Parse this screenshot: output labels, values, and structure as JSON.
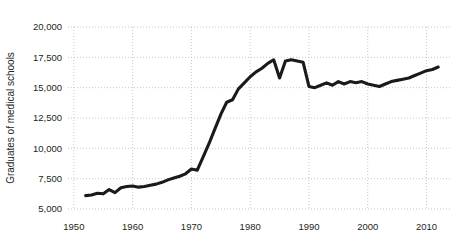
{
  "chart_data": {
    "type": "line",
    "title": "",
    "subtitle": "",
    "xlabel": "",
    "ylabel": "Graduates of medical schools",
    "xlim": [
      1949,
      2014
    ],
    "ylim": [
      5000,
      20000
    ],
    "grid": true,
    "legend": null,
    "legend_position": "none",
    "line_color": "#1a1a1a",
    "grid_color": "#b9b9b9",
    "background_color": "#ffffff",
    "x_tick_labels": [
      "1950",
      "1960",
      "1970",
      "1980",
      "1990",
      "2000",
      "2010"
    ],
    "x_ticks": [
      1950,
      1960,
      1970,
      1980,
      1990,
      2000,
      2010
    ],
    "y_tick_labels": [
      "5,000",
      "7,500",
      "10,000",
      "12,500",
      "15,000",
      "17,500",
      "20,000"
    ],
    "y_ticks": [
      5000,
      7500,
      10000,
      12500,
      15000,
      17500,
      20000
    ],
    "series": [
      {
        "name": "Graduates of medical schools",
        "x": [
          1952,
          1953,
          1954,
          1955,
          1956,
          1957,
          1958,
          1959,
          1960,
          1961,
          1962,
          1963,
          1964,
          1965,
          1966,
          1967,
          1968,
          1969,
          1970,
          1971,
          1972,
          1973,
          1974,
          1975,
          1976,
          1977,
          1978,
          1979,
          1980,
          1981,
          1982,
          1983,
          1984,
          1985,
          1986,
          1987,
          1988,
          1989,
          1990,
          1991,
          1992,
          1993,
          1994,
          1995,
          1996,
          1997,
          1998,
          1999,
          2000,
          2001,
          2002,
          2003,
          2004,
          2005,
          2006,
          2007,
          2008,
          2009,
          2010,
          2011,
          2012
        ],
        "values": [
          6100,
          6150,
          6300,
          6250,
          6600,
          6350,
          6750,
          6850,
          6900,
          6800,
          6850,
          6950,
          7050,
          7200,
          7400,
          7550,
          7700,
          7900,
          8300,
          8200,
          9300,
          10400,
          11600,
          12800,
          13800,
          14000,
          14900,
          15400,
          15900,
          16300,
          16600,
          17000,
          17300,
          15800,
          17200,
          17300,
          17200,
          17100,
          15100,
          15000,
          15200,
          15400,
          15200,
          15500,
          15300,
          15500,
          15400,
          15500,
          15300,
          15200,
          15100,
          15300,
          15500,
          15600,
          15700,
          15800,
          16000,
          16200,
          16400,
          16500,
          16700
        ]
      }
    ]
  },
  "axes": {
    "y_axis_title": "Graduates of medical schools"
  }
}
